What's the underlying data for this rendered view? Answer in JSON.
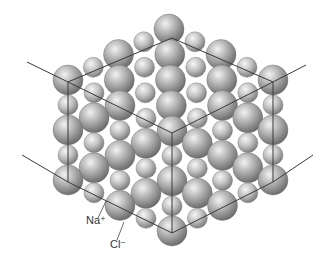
{
  "diagram": {
    "labels": {
      "sodium": "Na⁺",
      "chloride": "Cl⁻"
    },
    "colors": {
      "background": "#ffffff",
      "sphere_light": "#e6e6e6",
      "sphere_mid": "#a8a8a8",
      "sphere_dark": "#5a5a5a",
      "lines": "#3a3a3a",
      "label_text": "#333333"
    }
  }
}
